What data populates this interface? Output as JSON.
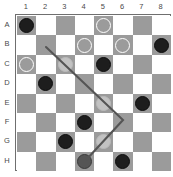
{
  "board": {
    "title": "checkers-board",
    "columns": [
      "1",
      "2",
      "3",
      "4",
      "5",
      "6",
      "7",
      "8"
    ],
    "rows": [
      "A",
      "B",
      "C",
      "D",
      "E",
      "F",
      "G",
      "H"
    ],
    "colors": {
      "dark_square": "#9b9b9b",
      "light_square": "#ffffff",
      "black_piece": "#1d1d1d",
      "white_piece_outline": "#ffffff",
      "ghost_piece": "#c9c9c9",
      "selected_piece": "#555555",
      "border": "#6f6f6f",
      "path_line": "#555555",
      "label_text": "#4a4a4a"
    },
    "pieces": [
      {
        "row": "A",
        "col": "1",
        "kind": "black",
        "label": "black-piece-a1"
      },
      {
        "row": "A",
        "col": "5",
        "kind": "white",
        "label": "white-piece-a5"
      },
      {
        "row": "B",
        "col": "4",
        "kind": "white",
        "label": "white-piece-b4"
      },
      {
        "row": "B",
        "col": "6",
        "kind": "white",
        "label": "white-piece-b6"
      },
      {
        "row": "B",
        "col": "8",
        "kind": "black",
        "label": "black-piece-b8"
      },
      {
        "row": "C",
        "col": "1",
        "kind": "white",
        "label": "white-piece-c1"
      },
      {
        "row": "C",
        "col": "3",
        "kind": "ghost",
        "label": "ghost-piece-c3"
      },
      {
        "row": "C",
        "col": "5",
        "kind": "black",
        "label": "black-piece-c5"
      },
      {
        "row": "D",
        "col": "2",
        "kind": "black",
        "label": "black-piece-d2"
      },
      {
        "row": "E",
        "col": "5",
        "kind": "ghost",
        "label": "ghost-piece-e5"
      },
      {
        "row": "E",
        "col": "7",
        "kind": "black",
        "label": "black-piece-e7"
      },
      {
        "row": "F",
        "col": "4",
        "kind": "black",
        "label": "black-piece-f4"
      },
      {
        "row": "G",
        "col": "3",
        "kind": "black",
        "label": "black-piece-g3"
      },
      {
        "row": "G",
        "col": "5",
        "kind": "ghost",
        "label": "ghost-piece-g5"
      },
      {
        "row": "H",
        "col": "4",
        "kind": "selected",
        "label": "selected-piece-h4"
      },
      {
        "row": "H",
        "col": "6",
        "kind": "black",
        "label": "black-piece-h6"
      }
    ],
    "move_path": {
      "label": "move-path-line",
      "points": [
        [
          46,
          47
        ],
        [
          123,
          120
        ],
        [
          86,
          160
        ]
      ],
      "stroke": "#555555",
      "stroke_width": 2.1
    }
  }
}
